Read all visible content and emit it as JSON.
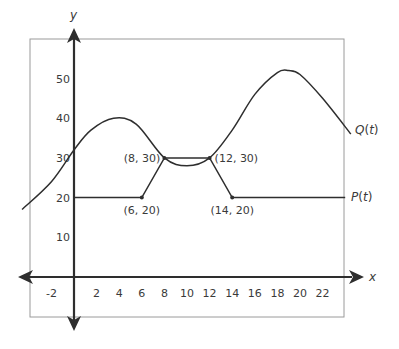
{
  "chart_data": {
    "type": "line",
    "title": "",
    "xlabel": "x",
    "ylabel": "y",
    "xlim": [
      -3.5,
      24.5
    ],
    "ylim": [
      -3,
      58
    ],
    "grid": false,
    "x_ticks": [
      -2,
      2,
      4,
      6,
      8,
      10,
      12,
      14,
      16,
      18,
      20,
      22
    ],
    "y_ticks": [
      10,
      20,
      30,
      40,
      50
    ],
    "series": [
      {
        "name": "P(t)",
        "label_italic": "t",
        "label_prefix": "P(",
        "label_suffix": ")",
        "kind": "piecewise-linear",
        "points": [
          [
            0,
            20
          ],
          [
            6,
            20
          ],
          [
            8,
            30
          ],
          [
            12,
            30
          ],
          [
            14,
            20
          ],
          [
            24,
            20
          ]
        ]
      },
      {
        "name": "Q(t)",
        "label_italic": "t",
        "label_prefix": "Q(",
        "label_suffix": ")",
        "kind": "smooth",
        "points": [
          [
            -4.6,
            17
          ],
          [
            -2,
            24
          ],
          [
            0,
            32
          ],
          [
            1.5,
            37
          ],
          [
            3.5,
            40
          ],
          [
            5.5,
            38.5
          ],
          [
            8,
            30
          ],
          [
            10,
            28
          ],
          [
            12,
            30
          ],
          [
            14,
            37
          ],
          [
            16,
            46
          ],
          [
            18,
            51.5
          ],
          [
            19,
            52
          ],
          [
            20,
            51
          ],
          [
            22,
            45
          ],
          [
            24.5,
            36
          ]
        ]
      }
    ],
    "annotations": [
      {
        "label": "(6, 20)",
        "x": 6,
        "y": 20,
        "position": "below"
      },
      {
        "label": "(8, 30)",
        "x": 8,
        "y": 30,
        "position": "left"
      },
      {
        "label": "(12, 30)",
        "x": 12,
        "y": 30,
        "position": "right"
      },
      {
        "label": "(14, 20)",
        "x": 14,
        "y": 20,
        "position": "below"
      }
    ],
    "legend_position": "inline-right"
  },
  "colors": {
    "axis": "#2e2e2e",
    "curve": "#2e2e2e",
    "frame": "#9a9a9a",
    "text": "#3a3a3a"
  }
}
